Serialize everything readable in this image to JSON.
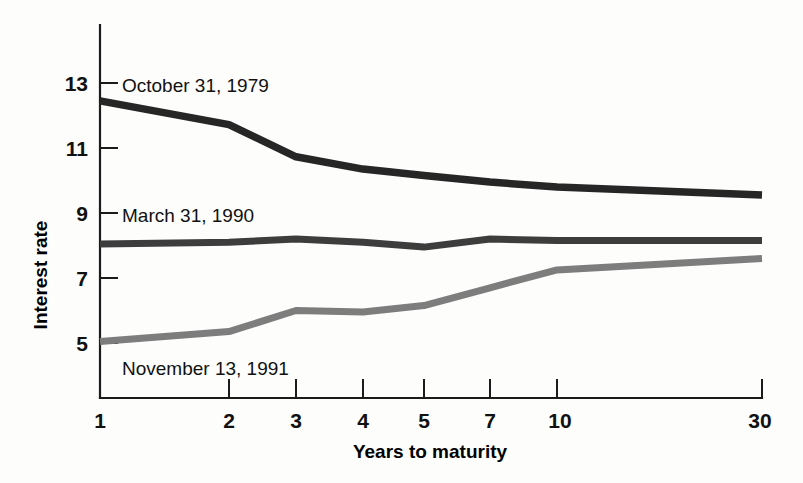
{
  "chart_data": {
    "type": "line",
    "title": "",
    "subtitle": "",
    "xlabel": "Years to maturity",
    "ylabel": "Interest rate",
    "categories": [
      "1",
      "2",
      "3",
      "4",
      "5",
      "7",
      "10",
      "30"
    ],
    "x_tick_labels": [
      "1",
      "2",
      "3",
      "4",
      "5",
      "7",
      "10",
      "30"
    ],
    "y_tick_labels": [
      "5",
      "7",
      "9",
      "11",
      "13"
    ],
    "y_ticks": [
      5,
      7,
      9,
      11,
      13
    ],
    "ylim": [
      4.0,
      13.9
    ],
    "grid": false,
    "legend_position": "inline-annotations",
    "series": [
      {
        "name": "October 31, 1979",
        "color": "#262626",
        "values": [
          12.45,
          11.72,
          10.73,
          10.35,
          10.15,
          9.95,
          9.8,
          9.55
        ]
      },
      {
        "name": "March 31, 1990",
        "color": "#3d3d3d",
        "values": [
          8.05,
          8.1,
          8.2,
          8.1,
          7.95,
          8.2,
          8.15,
          8.15
        ]
      },
      {
        "name": "November 13, 1991",
        "color": "#7d7d7d",
        "values": [
          5.05,
          5.35,
          6.0,
          5.95,
          6.15,
          6.7,
          7.25,
          7.6
        ]
      }
    ],
    "annotations": [
      {
        "text": "October 31, 1979",
        "series": "October 31, 1979"
      },
      {
        "text": "March 31, 1990",
        "series": "March 31, 1990"
      },
      {
        "text": "November 13, 1991",
        "series": "November 13, 1991"
      }
    ]
  }
}
